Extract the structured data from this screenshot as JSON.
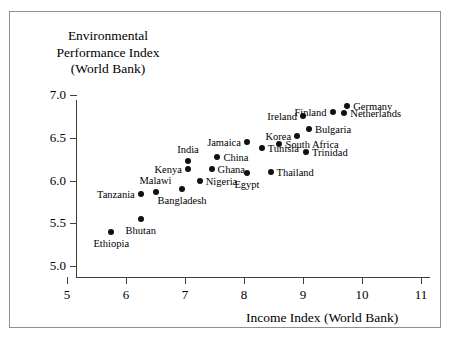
{
  "chart_data": {
    "type": "scatter",
    "title": "",
    "ylabel": "Environmental Performance Index (World Bank)",
    "ylabel_lines": [
      "Environmental",
      "Performance Index",
      "(World Bank)"
    ],
    "xlabel": "Income Index (World Bank)",
    "xlim": [
      5,
      11
    ],
    "ylim": [
      5.0,
      7.0
    ],
    "xticks": [
      "5",
      "6",
      "7",
      "8",
      "9",
      "10",
      "11"
    ],
    "xtick_values": [
      5,
      6,
      7,
      8,
      9,
      10,
      11
    ],
    "yticks": [
      "5.0",
      "5.5",
      "6.0",
      "6.5",
      "7.0"
    ],
    "ytick_values": [
      5.0,
      5.5,
      6.0,
      6.5,
      7.0
    ],
    "grid": false,
    "legend": false,
    "point_color": "#111111",
    "axis_color": "#3f3f3f",
    "frame_color": "#8f8f8f",
    "points": [
      {
        "label": "Ethiopia",
        "x": 5.75,
        "y": 5.4,
        "label_pos": "below"
      },
      {
        "label": "Bhutan",
        "x": 6.25,
        "y": 5.55,
        "label_pos": "below"
      },
      {
        "label": "Tanzania",
        "x": 6.25,
        "y": 5.84,
        "label_pos": "left"
      },
      {
        "label": "Malawi",
        "x": 6.5,
        "y": 5.87,
        "label_pos": "above"
      },
      {
        "label": "Bangladesh",
        "x": 6.95,
        "y": 5.9,
        "label_pos": "below"
      },
      {
        "label": "Nigeria",
        "x": 7.25,
        "y": 6.0,
        "label_pos": "right"
      },
      {
        "label": "Kenya",
        "x": 7.05,
        "y": 6.13,
        "label_pos": "left"
      },
      {
        "label": "India",
        "x": 7.05,
        "y": 6.23,
        "label_pos": "above"
      },
      {
        "label": "Ghana",
        "x": 7.45,
        "y": 6.14,
        "label_pos": "right"
      },
      {
        "label": "China",
        "x": 7.55,
        "y": 6.27,
        "label_pos": "right"
      },
      {
        "label": "Jamaica",
        "x": 8.05,
        "y": 6.45,
        "label_pos": "left"
      },
      {
        "label": "Egypt",
        "x": 8.05,
        "y": 6.09,
        "label_pos": "below"
      },
      {
        "label": "Thailand",
        "x": 8.45,
        "y": 6.1,
        "label_pos": "right"
      },
      {
        "label": "Tunisia",
        "x": 8.3,
        "y": 6.38,
        "label_pos": "right"
      },
      {
        "label": "South Africa",
        "x": 8.6,
        "y": 6.43,
        "label_pos": "right"
      },
      {
        "label": "Korea",
        "x": 8.9,
        "y": 6.52,
        "label_pos": "left"
      },
      {
        "label": "Trinidad",
        "x": 9.05,
        "y": 6.33,
        "label_pos": "right"
      },
      {
        "label": "Bulgaria",
        "x": 9.1,
        "y": 6.6,
        "label_pos": "right"
      },
      {
        "label": "Ireland",
        "x": 9.0,
        "y": 6.76,
        "label_pos": "left"
      },
      {
        "label": "Finland",
        "x": 9.5,
        "y": 6.8,
        "label_pos": "left"
      },
      {
        "label": "Netherlands",
        "x": 9.7,
        "y": 6.79,
        "label_pos": "right"
      },
      {
        "label": "Germany",
        "x": 9.75,
        "y": 6.87,
        "label_pos": "right"
      }
    ]
  }
}
